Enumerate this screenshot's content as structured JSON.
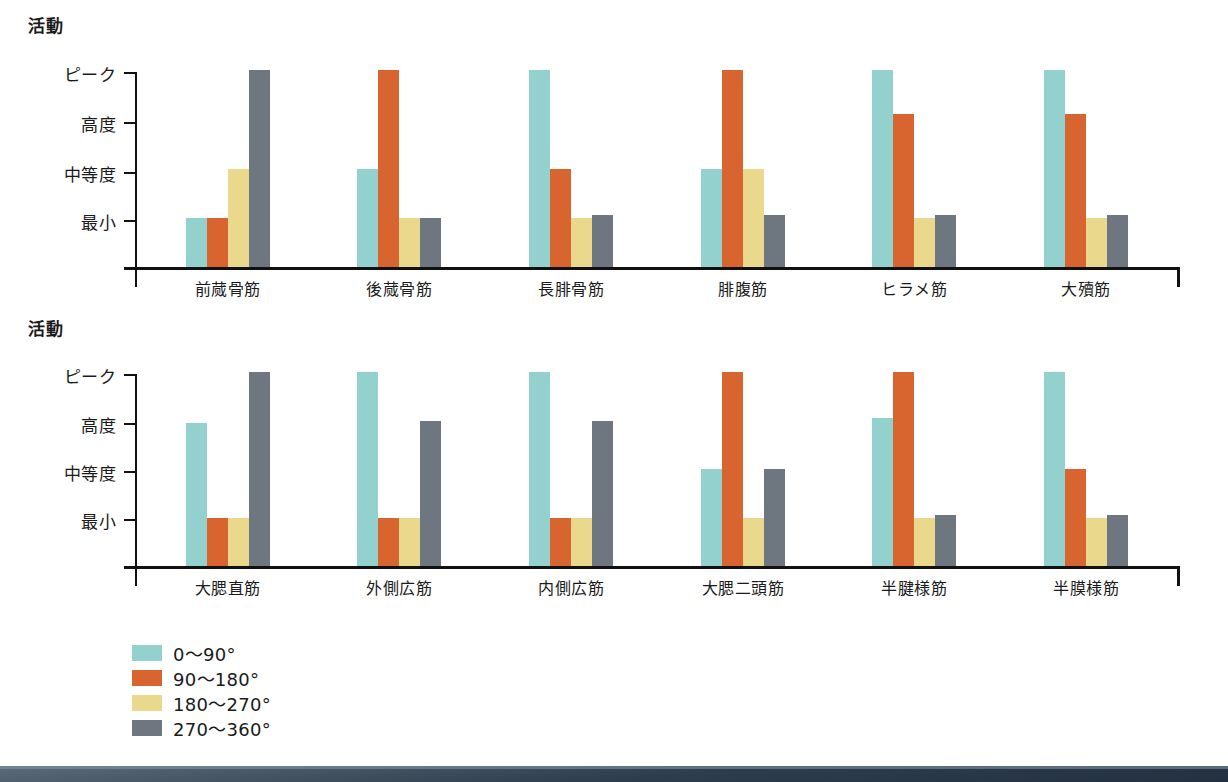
{
  "chart_data": [
    {
      "type": "bar",
      "title": "活動",
      "ylabel": "活動",
      "xlabel": "",
      "ytick_labels": [
        "ピーク",
        "高度",
        "中等度",
        "最小"
      ],
      "ylim": [
        0,
        4
      ],
      "grid": false,
      "legend_position": "bottom-left",
      "categories": [
        "前蒇骨筋",
        "後蒇骨筋",
        "長腓骨筋",
        "腓腹筋",
        "ヒラメ筋",
        "大殰筋"
      ],
      "series": [
        {
          "name": "0～90°",
          "color": "#93d1ce",
          "values": [
            1.0,
            2.0,
            4.0,
            2.0,
            4.0,
            4.0
          ]
        },
        {
          "name": "90～180°",
          "color": "#d8652f",
          "values": [
            1.0,
            4.0,
            2.0,
            4.0,
            3.1,
            3.1
          ]
        },
        {
          "name": "180～270°",
          "color": "#ead98c",
          "values": [
            2.0,
            1.0,
            1.0,
            2.0,
            1.0,
            1.0
          ]
        },
        {
          "name": "270～360°",
          "color": "#6e7680",
          "values": [
            4.0,
            1.0,
            1.05,
            1.05,
            1.05,
            1.05
          ]
        }
      ]
    },
    {
      "type": "bar",
      "title": "活動",
      "ylabel": "活動",
      "xlabel": "",
      "ytick_labels": [
        "ピーク",
        "高度",
        "中等度",
        "最小"
      ],
      "ylim": [
        0,
        4
      ],
      "grid": false,
      "legend_position": "bottom-left",
      "categories": [
        "大腮直筋",
        "外側広筋",
        "内側広筋",
        "大腮二頭筋",
        "半腱様筋",
        "半膜様筋"
      ],
      "series": [
        {
          "name": "0～90°",
          "color": "#93d1ce",
          "values": [
            2.95,
            4.0,
            4.0,
            2.0,
            3.05,
            4.0
          ]
        },
        {
          "name": "90～180°",
          "color": "#d8652f",
          "values": [
            1.0,
            1.0,
            1.0,
            4.0,
            4.0,
            2.0
          ]
        },
        {
          "name": "180～270°",
          "color": "#ead98c",
          "values": [
            1.0,
            1.0,
            1.0,
            1.0,
            1.0,
            1.0
          ]
        },
        {
          "name": "270～360°",
          "color": "#6e7680",
          "values": [
            4.0,
            3.0,
            3.0,
            2.0,
            1.05,
            1.05
          ]
        }
      ]
    }
  ],
  "charts": [
    {
      "axis_title": "活動",
      "yticks": [
        "ピーク",
        "高度",
        "中等度",
        "最小"
      ],
      "categories": [
        "前蒇骨筋",
        "後蒇骨筋",
        "長腓骨筋",
        "腓腹筋",
        "ヒラメ筋",
        "大殰筋"
      ]
    },
    {
      "axis_title": "活動",
      "yticks": [
        "ピーク",
        "高度",
        "中等度",
        "最小"
      ],
      "categories": [
        "大腮直筋",
        "外側広筋",
        "内側広筋",
        "大腮二頭筋",
        "半腱様筋",
        "半膜様筋"
      ]
    }
  ],
  "legend": {
    "items": [
      {
        "label": "0～90°",
        "color": "#93d1ce"
      },
      {
        "label": "90～180°",
        "color": "#d8652f"
      },
      {
        "label": "180～270°",
        "color": "#ead98c"
      },
      {
        "label": "270～360°",
        "color": "#6e7680"
      }
    ]
  }
}
